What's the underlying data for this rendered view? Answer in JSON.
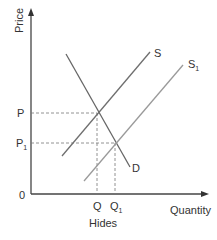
{
  "diagram": {
    "type": "supply-demand",
    "y_axis_label": "Price",
    "x_axis_label": "Quantity",
    "x_sublabel": "Hides",
    "origin_label": "0",
    "price_labels": {
      "p": "P",
      "p1": "P",
      "p1_sub": "1"
    },
    "quantity_labels": {
      "q": "Q",
      "q1": "Q",
      "q1_sub": "1"
    },
    "curves": {
      "demand": {
        "label": "D"
      },
      "supply": {
        "label": "S"
      },
      "supply_shifted": {
        "label": "S",
        "sub": "1"
      }
    },
    "colors": {
      "axis": "#444444",
      "demand": "#666666",
      "supply": "#777777",
      "supply_shifted": "#999999",
      "dashed": "#777777"
    }
  }
}
